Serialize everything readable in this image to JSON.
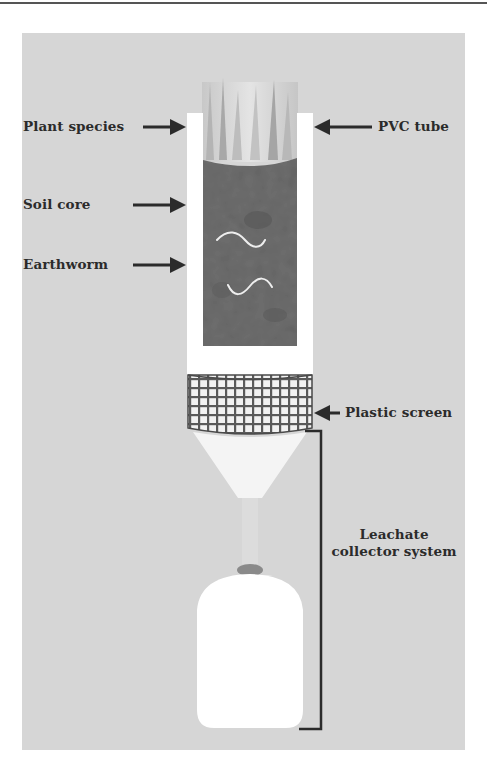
{
  "figure": {
    "labels": {
      "plant_species": "Plant species",
      "soil_core": "Soil core",
      "earthworm": "Earthworm",
      "pvc_tube": "PVC tube",
      "plastic_screen": "Plastic screen",
      "leachate_line1": "Leachate",
      "leachate_line2": "collector system"
    },
    "colors": {
      "background": "#d6d6d6",
      "tube": "#ffffff",
      "soil": "#6e6e6e",
      "mesh": "#5a5a5a",
      "text": "#2b2b2b",
      "worm": "#eeeeee"
    }
  }
}
